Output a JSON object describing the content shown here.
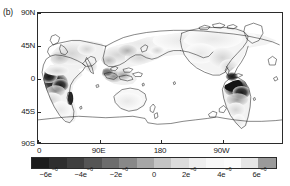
{
  "panel": {
    "label": "(b)"
  },
  "chart_data": {
    "type": "heatmap",
    "title": "",
    "subtitle": "",
    "xlabel": "",
    "ylabel": "",
    "projection": "cylindrical-equidistant",
    "grid": false,
    "legend_position": "bottom",
    "xlim": [
      0,
      360
    ],
    "ylim": [
      -90,
      90
    ],
    "x_ticks": [
      {
        "value": 0,
        "label": "0"
      },
      {
        "value": 90,
        "label": "90E"
      },
      {
        "value": 180,
        "label": "180"
      },
      {
        "value": 270,
        "label": "90W"
      }
    ],
    "y_ticks": [
      {
        "value": 90,
        "label": "90N"
      },
      {
        "value": 45,
        "label": "45N"
      },
      {
        "value": 0,
        "label": "0"
      },
      {
        "value": -45,
        "label": "45S"
      },
      {
        "value": -90,
        "label": "90S"
      }
    ],
    "colorbar": {
      "vmin": -7,
      "vmax": 7,
      "unit_exponent": -6,
      "colormap": "grayscale-discrete",
      "n_bands": 14,
      "band_colors": [
        "#1c1c1c",
        "#2e2e2e",
        "#3f3f3f",
        "#555555",
        "#6d6d6d",
        "#888888",
        "#a6a6a6",
        "#c4c4c4",
        "#dcdcdc",
        "#eeeeee",
        "#f7f7f7",
        "#fbfbfb",
        "#e6e6e6",
        "#9a9a9a"
      ],
      "ticks": [
        {
          "value": -6,
          "mantissa": "−6e",
          "exponent": "−6"
        },
        {
          "value": -4,
          "mantissa": "−4e",
          "exponent": "−6"
        },
        {
          "value": -2,
          "mantissa": "−2e",
          "exponent": "−6"
        },
        {
          "value": 0,
          "mantissa": "0",
          "exponent": ""
        },
        {
          "value": 2,
          "mantissa": "2e",
          "exponent": "−6"
        },
        {
          "value": 4,
          "mantissa": "4e",
          "exponent": "−6"
        },
        {
          "value": 6,
          "mantissa": "6e",
          "exponent": "−6"
        }
      ]
    },
    "field_regions": [
      {
        "name": "congo-basin",
        "lon": 22,
        "lat": -3,
        "value": -6.5,
        "shade": "very-dark"
      },
      {
        "name": "west-africa-coast",
        "lon": 8,
        "lat": 5,
        "value": -5.0,
        "shade": "dark"
      },
      {
        "name": "madagascar",
        "lon": 47,
        "lat": -20,
        "value": -5.5,
        "shade": "dark"
      },
      {
        "name": "amazon-basin",
        "lon": 298,
        "lat": -4,
        "value": -6.8,
        "shade": "very-dark"
      },
      {
        "name": "central-america",
        "lon": 275,
        "lat": 12,
        "value": -4.5,
        "shade": "dark"
      },
      {
        "name": "southeast-asia",
        "lon": 112,
        "lat": 2,
        "value": -3.5,
        "shade": "medium-dark"
      },
      {
        "name": "siberia",
        "lon": 95,
        "lat": 62,
        "value": 0.8,
        "shade": "near-white"
      },
      {
        "name": "central-asia",
        "lon": 80,
        "lat": 42,
        "value": 1.6,
        "shade": "light"
      },
      {
        "name": "europe",
        "lon": 18,
        "lat": 52,
        "value": 1.0,
        "shade": "near-white"
      },
      {
        "name": "north-america",
        "lon": 260,
        "lat": 50,
        "value": 0.9,
        "shade": "near-white"
      },
      {
        "name": "eastern-us",
        "lon": 275,
        "lat": 38,
        "value": -1.5,
        "shade": "light-gray"
      },
      {
        "name": "australia",
        "lon": 134,
        "lat": -25,
        "value": 0.3,
        "shade": "near-white"
      },
      {
        "name": "southern-africa",
        "lon": 25,
        "lat": -25,
        "value": -1.0,
        "shade": "light-gray"
      },
      {
        "name": "antarctica",
        "lon": 180,
        "lat": -80,
        "value": 0.0,
        "shade": "white"
      },
      {
        "name": "ocean",
        "lon": 200,
        "lat": 20,
        "value": 0.0,
        "shade": "white"
      }
    ]
  }
}
